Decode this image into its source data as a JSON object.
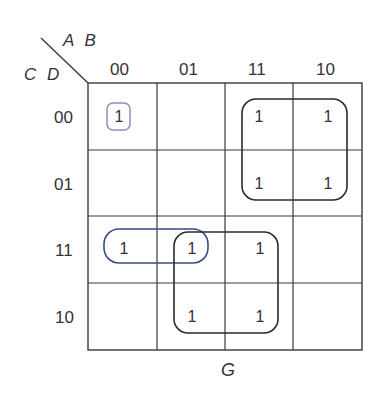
{
  "diagram": {
    "type": "karnaugh-map",
    "function_name": "G",
    "column_variables": "A B",
    "row_variables": "C D",
    "column_headers": [
      "00",
      "01",
      "11",
      "10"
    ],
    "row_headers": [
      "00",
      "01",
      "11",
      "10"
    ],
    "cells": [
      [
        "1",
        "",
        "1",
        "1"
      ],
      [
        "",
        "",
        "1",
        "1"
      ],
      [
        "1",
        "1",
        "1",
        ""
      ],
      [
        "",
        "1",
        "1",
        ""
      ]
    ],
    "groupings": [
      {
        "name": "single-ab00-cd00",
        "cells": [
          [
            0,
            0
          ]
        ],
        "color": "#8a90b8"
      },
      {
        "name": "quad-ab11-10-cd00-01",
        "cells": [
          [
            0,
            2
          ],
          [
            0,
            3
          ],
          [
            1,
            2
          ],
          [
            1,
            3
          ]
        ],
        "color": "#2b2b2b"
      },
      {
        "name": "pair-ab00-01-cd11",
        "cells": [
          [
            2,
            0
          ],
          [
            2,
            1
          ]
        ],
        "color": "#3a4a8a"
      },
      {
        "name": "quad-ab01-11-cd11-10",
        "cells": [
          [
            2,
            1
          ],
          [
            2,
            2
          ],
          [
            3,
            1
          ],
          [
            3,
            2
          ]
        ],
        "color": "#2b2b2b"
      }
    ],
    "colors": {
      "grid": "#3a3a3a",
      "text": "#333333",
      "blue_loop": "#3a4a8a",
      "light_loop": "#8a90b8",
      "black_loop": "#2b2b2b"
    }
  }
}
